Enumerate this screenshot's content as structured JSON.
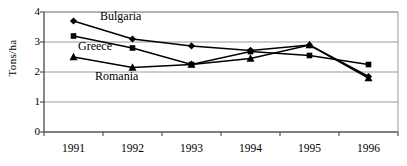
{
  "chart_data": {
    "type": "line",
    "title": "",
    "subtitle": "",
    "xlabel": "",
    "ylabel": "Tons/ha",
    "categories": [
      "1991",
      "1992",
      "1993",
      "1994",
      "1995",
      "1996"
    ],
    "x": [
      1991,
      1992,
      1993,
      1994,
      1995,
      1996
    ],
    "ylim": [
      0,
      4
    ],
    "y_ticks": [
      "0",
      "1",
      "2",
      "3",
      "4"
    ],
    "y_tick_values": [
      0,
      1,
      2,
      3,
      4
    ],
    "grid": "horizontal",
    "legend_position": "inline-annotations",
    "series": [
      {
        "name": "Bulgaria",
        "marker": "diamond",
        "color": "#000000",
        "values": [
          3.7,
          3.1,
          2.87,
          2.72,
          2.9,
          1.85
        ]
      },
      {
        "name": "Greece",
        "marker": "square",
        "color": "#000000",
        "values": [
          3.2,
          2.8,
          2.25,
          2.68,
          2.55,
          2.25
        ]
      },
      {
        "name": "Romania",
        "marker": "triangle",
        "color": "#000000",
        "values": [
          2.5,
          2.15,
          2.25,
          2.45,
          2.9,
          1.8
        ]
      }
    ],
    "annotations": [
      {
        "text": "Bulgaria",
        "series": "Bulgaria"
      },
      {
        "text": "Greece",
        "series": "Greece"
      },
      {
        "text": "Romania",
        "series": "Romania"
      }
    ]
  },
  "style": {
    "axis_color": "#555555",
    "grid_color": "#9a9a9a",
    "line_color": "#000000",
    "background": "#ffffff"
  }
}
